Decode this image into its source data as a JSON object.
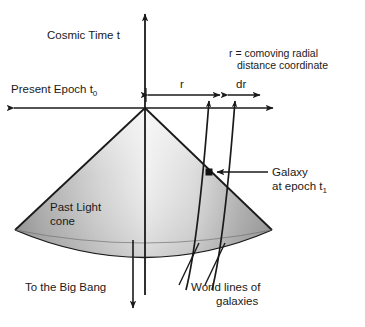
{
  "figure": {
    "background": "#ffffff",
    "ink_color": "#1a1a1a",
    "cone_fill_light": "#f0f0f0",
    "cone_fill_dark": "#9a9a9a"
  },
  "labels": {
    "cosmic_time": "Cosmic Time  t",
    "present_epoch": "Present Epoch t",
    "present_epoch_sub": "0",
    "comoving_line1": "r = comoving radial",
    "comoving_line2": "distance coordinate",
    "r_measure": "r",
    "dr_measure": "dr",
    "past_light_line1": "Past Light",
    "past_light_line2": "cone",
    "galaxy_line1": "Galaxy",
    "galaxy_line2": "at epoch t",
    "galaxy_line2_sub": "1",
    "big_bang": "To the Big Bang",
    "world_lines_line1": "World lines of",
    "world_lines_line2": "galaxies"
  },
  "geometry": {
    "apex_x": 145,
    "apex_y": 108,
    "time_axis_top_y": 12,
    "time_axis_bottom_y": 295,
    "horizontal_axis_y": 108,
    "horizontal_axis_left_x": 12,
    "horizontal_axis_right_x": 275,
    "cone_left_corner_x": 15,
    "cone_left_corner_y": 230,
    "cone_right_corner_x": 272,
    "cone_right_corner_y": 230,
    "cone_bottom_y": 268,
    "galaxy_marker_x": 209,
    "galaxy_marker_y": 172,
    "r_start_x": 146,
    "r_end_x": 222,
    "dr_start_x": 226,
    "dr_end_x": 262,
    "measure_bar_y": 95,
    "big_bang_arrow_x": 133,
    "big_bang_arrow_bottom_y": 310
  }
}
